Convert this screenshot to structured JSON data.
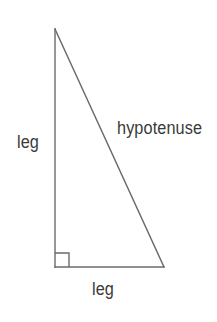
{
  "figure": {
    "kind": "right-triangle-diagram",
    "background_color": "#ffffff",
    "stroke_color": "#6b6b6b",
    "text_color": "#3a3a3a",
    "stroke_width": 1.4,
    "canvas": {
      "width": 217,
      "height": 322
    }
  },
  "geometry": {
    "vertices": {
      "apex": {
        "x": 55,
        "y": 29
      },
      "right_angle_corner": {
        "x": 55,
        "y": 267
      },
      "base_right": {
        "x": 164,
        "y": 267
      }
    },
    "sides": [
      {
        "name": "vertical-leg",
        "from": "apex",
        "to": "right_angle_corner"
      },
      {
        "name": "horizontal-leg",
        "from": "right_angle_corner",
        "to": "base_right"
      },
      {
        "name": "hypotenuse",
        "from": "apex",
        "to": "base_right"
      }
    ],
    "right_angle_marker": {
      "corner_x": 55,
      "corner_y": 267,
      "size": 14,
      "path": "M 55 253 L 69 253 L 69 267"
    }
  },
  "labels": {
    "hypotenuse": "hypotenuse",
    "leg_vertical": "leg",
    "leg_horizontal": "leg"
  }
}
